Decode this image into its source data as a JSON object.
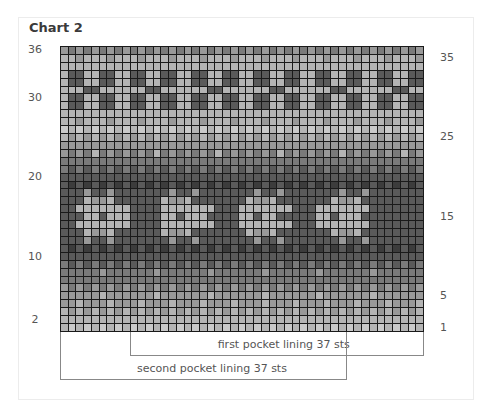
{
  "chart_data": {
    "type": "heatmap",
    "title": "Chart 2",
    "subtype": "knitting colorwork chart",
    "columns": 47,
    "rows": 36,
    "shade_palette": [
      "#c9c9c9",
      "#b4b4b4",
      "#999999",
      "#7a7a7a",
      "#5a5a5a",
      "#3c3c3c"
    ],
    "left_row_labels": [
      {
        "label": "36",
        "row": 36
      },
      {
        "label": "30",
        "row": 30
      },
      {
        "label": "20",
        "row": 20
      },
      {
        "label": "10",
        "row": 10
      },
      {
        "label": "2",
        "row": 2
      }
    ],
    "right_row_labels": [
      {
        "label": "35",
        "row": 35
      },
      {
        "label": "25",
        "row": 25
      },
      {
        "label": "15",
        "row": 15
      },
      {
        "label": "5",
        "row": 5
      },
      {
        "label": "1",
        "row": 1
      }
    ],
    "annotations": [
      {
        "text": "first pocket lining 37 sts",
        "from_col": 10,
        "to_col": 47
      },
      {
        "text": "second pocket lining 37 sts",
        "from_col": 1,
        "to_col": 37
      }
    ],
    "grid_rows_top_to_bottom": [
      "23232323232323232323232323232323232323232323232",
      "11211121112111211121112111211121112111211121112",
      "11111111111111111111111111111111111111111111111",
      "14411441144114411441144114411441144114411441144",
      "14411441144114411441144114411441144114411441144",
      "11144111111441111114411111144111111441111114411",
      "14411441144114411441144114411441144114411441144",
      "14411441144114411441144114411441144114411441144",
      "11111111111111111111111111111111111111111111111",
      "11211121112111211121112111211121112111211121112",
      "01010101010101010101010101010101010101010101010",
      "12121212121212121212121212121212121212121212121",
      "22222222222222222222222222222222222222222222222",
      "23231323232313232323132323231323232313232323132",
      "33333333333333333333333333333333333333333333333",
      "34343434343434343434343434343434343434343434343",
      "44444444444444444444444444444444444444444444444",
      "45454545454545454545454545454545454545454545454",
      "44424424444444244244444442442444444424424444444",
      "44412214444441221444444412214444444122144444444",
      "44111111144441111111444111111144411111114444444",
      "44411411144441141114444114114444411411144444444",
      "44111111144441111111444111111144411111114444444",
      "44412214444441221444444412214444444122144444444",
      "44424424444444244244444442442444444424424444444",
      "45454545454545454545454545454545454545454545454",
      "44444444444444444444444444444444444444444444444",
      "34343434343434343434343434343434343434343434343",
      "33333233333323333332333333233333323333332333333",
      "33333333333333333333333333333333333333333333333",
      "23232323232323232323232323232323232323232323232",
      "22222122222212222221222222122222212222221222222",
      "22122212221222122212221222122212221222122212221",
      "12121212121212121212121212121212121212121212121",
      "11111111111111111111111111111111111111111111111",
      "10101010101010101010101010101010101010101010101"
    ]
  }
}
